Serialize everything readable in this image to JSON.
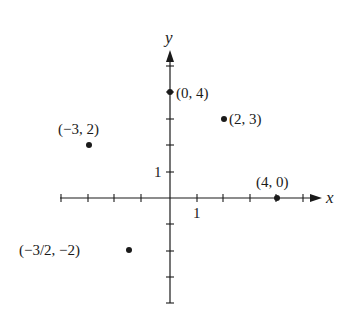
{
  "diagram": {
    "type": "coordinate-plane",
    "axes": {
      "x_label": "x",
      "y_label": "y",
      "x_unit_label": "1",
      "y_unit_label": "1",
      "x_range": [
        -4,
        5
      ],
      "y_range": [
        -4,
        5
      ]
    },
    "points": [
      {
        "x": -3,
        "y": 2,
        "label": "(−3, 2)"
      },
      {
        "x": 0,
        "y": 4,
        "label": "(0, 4)"
      },
      {
        "x": 2,
        "y": 3,
        "label": "(2, 3)"
      },
      {
        "x": 4,
        "y": 0,
        "label": "(4, 0)"
      },
      {
        "x": -1.5,
        "y": -2,
        "label": "(−3/2, −2)"
      }
    ],
    "colors": {
      "ink": "#1a1a1a",
      "background": "#ffffff"
    }
  }
}
